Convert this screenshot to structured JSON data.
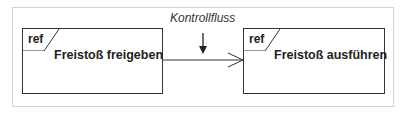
{
  "diagram": {
    "type": "UML interaction overview fragment",
    "nodes": [
      {
        "id": "left",
        "tag": "ref",
        "title": "Freistoß freigeben"
      },
      {
        "id": "right",
        "tag": "ref",
        "title": "Freistoß ausführen"
      }
    ],
    "edges": [
      {
        "from": "left",
        "to": "right",
        "kind": "open-arrow"
      }
    ],
    "annotation": {
      "label": "Kontrollfluss",
      "points_to": "edge"
    }
  },
  "colors": {
    "stroke": "#333333",
    "frame": "#d4d4d4",
    "text": "#222222"
  }
}
